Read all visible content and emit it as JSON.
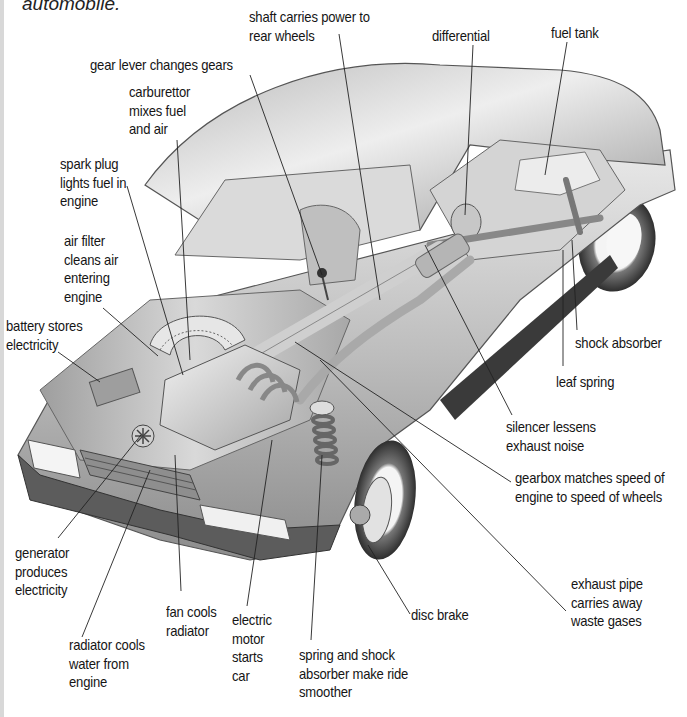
{
  "diagram": {
    "caption": "automobile.",
    "labels": [
      {
        "id": "shaft",
        "lines": [
          "shaft carries power to",
          "rear wheels"
        ],
        "x": 249,
        "y": 8,
        "leader": [
          [
            339,
            34
          ],
          [
            380,
            300
          ]
        ]
      },
      {
        "id": "differential",
        "lines": [
          "differential"
        ],
        "x": 432,
        "y": 27,
        "leader": [
          [
            473,
            45
          ],
          [
            465,
            215
          ]
        ]
      },
      {
        "id": "fuel-tank",
        "lines": [
          "fuel tank"
        ],
        "x": 551,
        "y": 24,
        "leader": [
          [
            567,
            42
          ],
          [
            545,
            175
          ]
        ]
      },
      {
        "id": "gear-lever",
        "lines": [
          "gear lever changes gears"
        ],
        "x": 90,
        "y": 56,
        "leader": [
          [
            250,
            75
          ],
          [
            322,
            275
          ]
        ]
      },
      {
        "id": "carburettor",
        "lines": [
          "carburettor",
          "mixes fuel",
          "and air"
        ],
        "x": 129,
        "y": 83,
        "leader": [
          [
            177,
            140
          ],
          [
            190,
            360
          ]
        ]
      },
      {
        "id": "spark-plug",
        "lines": [
          "spark plug",
          "lights fuel in",
          "engine"
        ],
        "x": 60,
        "y": 155,
        "leader": [
          [
            127,
            186
          ],
          [
            183,
            375
          ]
        ]
      },
      {
        "id": "air-filter",
        "lines": [
          "air filter",
          "cleans air",
          "entering",
          "engine"
        ],
        "x": 64,
        "y": 232,
        "leader": [
          [
            103,
            308
          ],
          [
            158,
            356
          ]
        ]
      },
      {
        "id": "battery",
        "lines": [
          "battery stores",
          "electricity"
        ],
        "x": 6,
        "y": 317,
        "leader": [
          [
            58,
            352
          ],
          [
            100,
            382
          ]
        ]
      },
      {
        "id": "shock-absorber",
        "lines": [
          "shock absorber"
        ],
        "x": 575,
        "y": 334,
        "leader": [
          [
            577,
            330
          ],
          [
            572,
            240
          ]
        ]
      },
      {
        "id": "leaf-spring",
        "lines": [
          "leaf spring"
        ],
        "x": 556,
        "y": 373,
        "leader": [
          [
            563,
            366
          ],
          [
            563,
            250
          ]
        ]
      },
      {
        "id": "silencer",
        "lines": [
          "silencer lessens",
          "exhaust noise"
        ],
        "x": 506,
        "y": 418,
        "leader": [
          [
            512,
            415
          ],
          [
            425,
            245
          ]
        ]
      },
      {
        "id": "gearbox",
        "lines": [
          "gearbox matches speed of",
          "engine to speed of wheels"
        ],
        "x": 515,
        "y": 469,
        "leader": [
          [
            511,
            482
          ],
          [
            295,
            342
          ]
        ]
      },
      {
        "id": "generator",
        "lines": [
          "generator",
          "produces",
          "electricity"
        ],
        "x": 15,
        "y": 544,
        "leader": [
          [
            58,
            538
          ],
          [
            141,
            435
          ]
        ]
      },
      {
        "id": "exhaust-pipe",
        "lines": [
          "exhaust pipe",
          "carries away",
          "waste gases"
        ],
        "x": 571,
        "y": 575,
        "leader": [
          [
            566,
            611
          ],
          [
            320,
            360
          ]
        ]
      },
      {
        "id": "fan",
        "lines": [
          "fan cools",
          "radiator"
        ],
        "x": 166,
        "y": 603,
        "leader": [
          [
            181,
            591
          ],
          [
            175,
            455
          ]
        ]
      },
      {
        "id": "electric-motor",
        "lines": [
          "electric",
          "motor",
          "starts",
          "car"
        ],
        "x": 232,
        "y": 611,
        "leader": [
          [
            247,
            606
          ],
          [
            272,
            440
          ]
        ]
      },
      {
        "id": "disc-brake",
        "lines": [
          "disc brake"
        ],
        "x": 411,
        "y": 606,
        "leader": [
          [
            410,
            614
          ],
          [
            368,
            545
          ]
        ]
      },
      {
        "id": "radiator",
        "lines": [
          "radiator cools",
          "water from",
          "engine"
        ],
        "x": 69,
        "y": 636,
        "leader": [
          [
            82,
            637
          ],
          [
            150,
            470
          ]
        ]
      },
      {
        "id": "spring-shock",
        "lines": [
          "spring and shock",
          "absorber make ride",
          "smoother"
        ],
        "x": 299,
        "y": 646,
        "leader": [
          [
            311,
            640
          ],
          [
            322,
            455
          ]
        ]
      }
    ]
  }
}
